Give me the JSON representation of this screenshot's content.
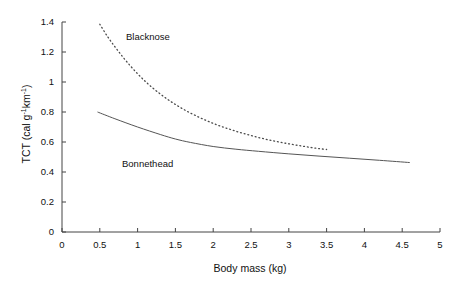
{
  "chart_data": {
    "type": "line",
    "title": "",
    "xlabel": "Body mass (kg)",
    "ylabel": "TCT (cal g⁻¹km⁻¹)",
    "ylabel_parts": {
      "prefix": "TCT (cal g",
      "sup1": "-1",
      "mid": "km",
      "sup2": "-1",
      "suffix": ")"
    },
    "xlim": [
      0,
      5
    ],
    "ylim": [
      0,
      1.4
    ],
    "xticks": [
      "0",
      "0.5",
      "1",
      "1.5",
      "2",
      "2.5",
      "3",
      "3.5",
      "4",
      "4.5",
      "5"
    ],
    "xtick_values": [
      0,
      0.5,
      1,
      1.5,
      2,
      2.5,
      3,
      3.5,
      4,
      4.5,
      5
    ],
    "yticks": [
      "0",
      "0.2",
      "0.4",
      "0.6",
      "0.8",
      "1",
      "1.2",
      "1.4"
    ],
    "ytick_values": [
      0,
      0.2,
      0.4,
      0.6,
      0.8,
      1,
      1.2,
      1.4
    ],
    "grid": false,
    "legend_position": "inline-annotation",
    "series": [
      {
        "name": "Blacknose",
        "style": "dotted",
        "color": "#4a4a4a",
        "x": [
          0.5,
          0.6,
          0.7,
          0.8,
          0.9,
          1.0,
          1.1,
          1.2,
          1.3,
          1.4,
          1.5,
          1.6,
          1.7,
          1.8,
          1.9,
          2.0,
          2.1,
          2.2,
          2.3,
          2.4,
          2.5,
          2.6,
          2.7,
          2.8,
          2.9,
          3.0,
          3.1,
          3.2,
          3.3,
          3.4,
          3.5
        ],
        "values": [
          1.385,
          1.305,
          1.235,
          1.17,
          1.11,
          1.055,
          1.005,
          0.96,
          0.92,
          0.883,
          0.85,
          0.82,
          0.793,
          0.768,
          0.745,
          0.724,
          0.705,
          0.688,
          0.672,
          0.657,
          0.643,
          0.63,
          0.618,
          0.607,
          0.597,
          0.588,
          0.579,
          0.571,
          0.563,
          0.556,
          0.55
        ]
      },
      {
        "name": "Bonnethead",
        "style": "solid",
        "color": "#555555",
        "x": [
          0.47,
          0.7,
          1.0,
          1.3,
          1.5,
          1.7,
          2.0,
          2.3,
          2.6,
          3.0,
          3.4,
          3.8,
          4.2,
          4.6
        ],
        "values": [
          0.8,
          0.755,
          0.7,
          0.65,
          0.62,
          0.597,
          0.57,
          0.552,
          0.538,
          0.521,
          0.506,
          0.492,
          0.478,
          0.463
        ]
      }
    ],
    "annotations": [
      {
        "text": "Blacknose",
        "x": 1.0,
        "y": 1.22
      },
      {
        "text": "Bonnethead",
        "x": 0.95,
        "y": 0.43
      }
    ],
    "colors": {
      "axis": "#444444",
      "text": "#111111",
      "background": "#ffffff"
    }
  }
}
